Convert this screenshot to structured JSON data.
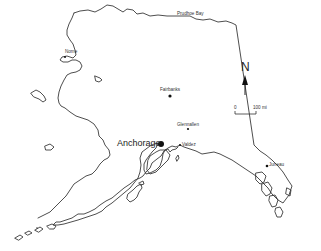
{
  "map": {
    "region": "Alaska",
    "style": "outline",
    "colors": {
      "coastline": "#3a3a3a",
      "background": "#ffffff",
      "city_marker": "#111111"
    },
    "cities": [
      {
        "name": "Prudhoe Bay",
        "x": 199,
        "y": 19,
        "size": "small",
        "marker": "none"
      },
      {
        "name": "Nome",
        "x": 71,
        "y": 52,
        "size": "small",
        "marker": "dot"
      },
      {
        "name": "Fairbanks",
        "x": 170,
        "y": 96,
        "size": "small",
        "marker": "dot"
      },
      {
        "name": "Glennallen",
        "x": 188,
        "y": 128,
        "size": "small",
        "marker": "dot"
      },
      {
        "name": "Anchorage",
        "x": 161,
        "y": 144,
        "size": "large",
        "marker": "large-dot"
      },
      {
        "name": "Valdez",
        "x": 180,
        "y": 145,
        "size": "small",
        "marker": "dot"
      },
      {
        "name": "Juneau",
        "x": 267,
        "y": 165,
        "size": "small",
        "marker": "dot"
      }
    ],
    "north_arrow": {
      "label": "N"
    },
    "scale_bar": {
      "start_label": "0",
      "end_label": "100 mi"
    }
  }
}
